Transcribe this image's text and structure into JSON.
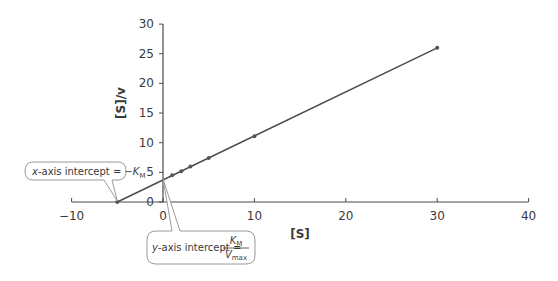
{
  "chart_data": {
    "type": "line",
    "title": "",
    "xlabel": "[S]",
    "ylabel": "[S]/v",
    "xlim": [
      -10,
      40
    ],
    "ylim": [
      0,
      30
    ],
    "x_ticks": [
      -10,
      0,
      10,
      20,
      30,
      40
    ],
    "y_ticks": [
      0,
      5,
      10,
      15,
      20,
      25,
      30
    ],
    "grid": false,
    "legend": null,
    "series": [
      {
        "name": "data points",
        "x": [
          1,
          2,
          3,
          5,
          10,
          30
        ],
        "y": [
          4.5,
          5.2,
          6.0,
          7.4,
          11.1,
          26.0
        ]
      },
      {
        "name": "fitted line (extrapolated)",
        "x": [
          -5,
          30
        ],
        "y": [
          0,
          26.0
        ]
      }
    ],
    "x_intercept": [
      -5,
      0
    ],
    "y_intercept": [
      0,
      3.9
    ],
    "annotations": [
      {
        "id": "x_intercept",
        "prefix_italic": "x",
        "text": "-axis intercept = −",
        "symbol": "K",
        "symbol_sub": "M",
        "points_to": [
          -5,
          0
        ]
      },
      {
        "id": "y_intercept",
        "prefix_italic": "y",
        "text": "-axis intercept = ",
        "numerator": "K",
        "numerator_sub": "M",
        "denominator": "V",
        "denominator_sub": "max",
        "points_to": [
          0,
          3.9
        ]
      }
    ]
  },
  "colors": {
    "axis": "#4a4a4a",
    "line": "#4a4a4a",
    "point": "#555555",
    "callout_border": "#9a9a9a",
    "callout_fill": "#ffffff",
    "text": "#3a3a3a"
  }
}
